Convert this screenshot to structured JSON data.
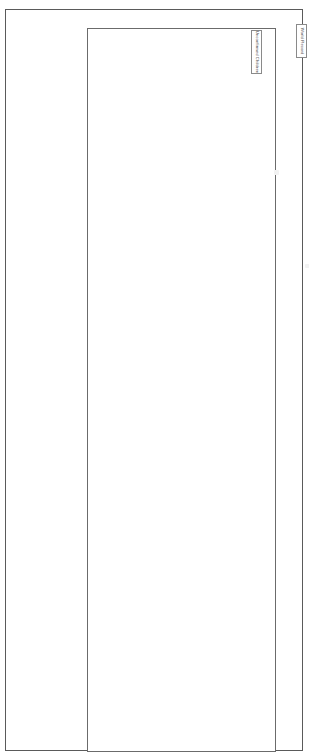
{
  "page": {
    "width": 309,
    "height": 756,
    "background_color": "#ffffff",
    "frame_color": "#5a5a5a"
  },
  "content_box": {
    "name": "empty content area",
    "border_color": "#6b6b6b"
  },
  "labels": {
    "unconfirmed": {
      "text": "Unconfirmed Children",
      "orientation": "vertical",
      "border_color": "#8a8a8a",
      "text_color": "#3a3a3a"
    },
    "world_record": {
      "text": "World Record",
      "orientation": "vertical",
      "border_color": "#8a8a8a",
      "text_color": "#3a3a3a"
    }
  },
  "marks": {
    "upper_speck": "",
    "lower_speck": ""
  }
}
